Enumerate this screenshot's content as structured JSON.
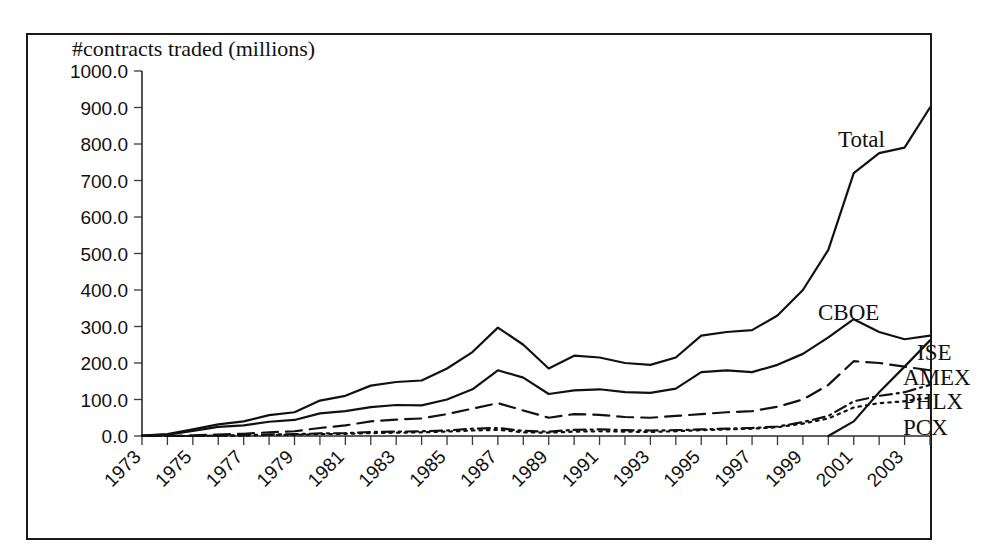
{
  "chart_data": {
    "type": "line",
    "title": "#contracts traded (millions)",
    "xlabel": "",
    "ylabel": "",
    "ylim": [
      0,
      1000
    ],
    "ytick_step": 100,
    "ytick_labels": [
      "0.0",
      "100.0",
      "200.0",
      "300.0",
      "400.0",
      "500.0",
      "600.0",
      "700.0",
      "800.0",
      "900.0",
      "1000.0"
    ],
    "xlim": [
      1973,
      2004
    ],
    "xtick_labels": [
      "1973",
      "1975",
      "1977",
      "1979",
      "1981",
      "1983",
      "1985",
      "1987",
      "1989",
      "1991",
      "1993",
      "1995",
      "1997",
      "1999",
      "2001",
      "2003"
    ],
    "xtick_label_rotation": -45,
    "xtick_every_year": true,
    "grid": false,
    "legend_position": "inline-right-of-lines",
    "x": [
      1973,
      1974,
      1975,
      1976,
      1977,
      1978,
      1979,
      1980,
      1981,
      1982,
      1983,
      1984,
      1985,
      1986,
      1987,
      1988,
      1989,
      1990,
      1991,
      1992,
      1993,
      1994,
      1995,
      1996,
      1997,
      1998,
      1999,
      2000,
      2001,
      2002,
      2003,
      2004
    ],
    "series": [
      {
        "name": "Total",
        "line_style": "solid",
        "values": [
          1,
          5,
          18,
          32,
          40,
          57,
          65,
          97,
          110,
          138,
          148,
          152,
          185,
          230,
          297,
          250,
          185,
          220,
          215,
          200,
          195,
          215,
          275,
          285,
          290,
          330,
          400,
          510,
          720,
          775,
          790,
          900
        ]
      },
      {
        "name": "CBOE",
        "line_style": "solid",
        "values": [
          1,
          4,
          14,
          25,
          29,
          39,
          44,
          62,
          68,
          79,
          85,
          84,
          100,
          128,
          180,
          160,
          115,
          125,
          128,
          120,
          118,
          130,
          175,
          180,
          175,
          195,
          225,
          270,
          320,
          285,
          265,
          275
        ]
      },
      {
        "name": "AMEX",
        "line_style": "dashed",
        "values": [
          0,
          0,
          2,
          4,
          6,
          10,
          13,
          22,
          29,
          40,
          45,
          48,
          60,
          75,
          90,
          70,
          50,
          60,
          58,
          52,
          50,
          55,
          60,
          65,
          68,
          80,
          100,
          140,
          205,
          200,
          190,
          180
        ]
      },
      {
        "name": "PHLX",
        "line_style": "dash-dot",
        "values": [
          0,
          0,
          0,
          1,
          2,
          4,
          5,
          7,
          8,
          11,
          12,
          13,
          15,
          20,
          22,
          14,
          12,
          17,
          18,
          16,
          15,
          16,
          18,
          20,
          22,
          26,
          38,
          55,
          95,
          110,
          120,
          140
        ]
      },
      {
        "name": "PCX",
        "line_style": "dotted",
        "values": [
          0,
          0,
          0,
          1,
          1,
          3,
          3,
          5,
          6,
          8,
          9,
          10,
          12,
          15,
          17,
          10,
          9,
          12,
          13,
          12,
          11,
          13,
          16,
          18,
          20,
          24,
          34,
          48,
          78,
          90,
          95,
          105
        ]
      },
      {
        "name": "ISE",
        "line_style": "solid",
        "values": [
          null,
          null,
          null,
          null,
          null,
          null,
          null,
          null,
          null,
          null,
          null,
          null,
          null,
          null,
          null,
          null,
          null,
          null,
          null,
          null,
          null,
          null,
          null,
          null,
          null,
          null,
          null,
          0,
          40,
          120,
          190,
          262
        ]
      }
    ],
    "annotations": [
      {
        "text": "Total",
        "x_px": 838,
        "y_px": 147
      },
      {
        "text": "CBOE",
        "x_px": 818,
        "y_px": 320
      },
      {
        "text": "ISE",
        "x_px": 917,
        "y_px": 360
      },
      {
        "text": "AMEX",
        "x_px": 903,
        "y_px": 385
      },
      {
        "text": "PHLX",
        "x_px": 903,
        "y_px": 409
      },
      {
        "text": "PCX",
        "x_px": 903,
        "y_px": 435
      }
    ]
  }
}
